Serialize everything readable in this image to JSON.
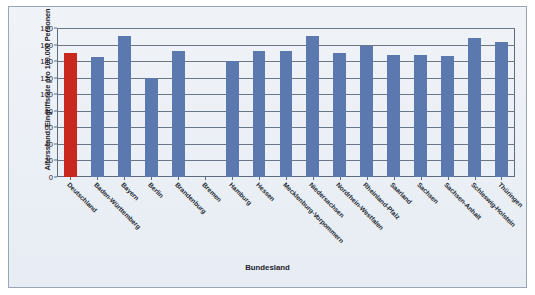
{
  "chart_data": {
    "type": "bar",
    "title": "",
    "xlabel": "Bundesland",
    "ylabel": "Altersstand. Eingriffsrate pro 100.000 Personen",
    "ylim": [
      0,
      180
    ],
    "ytick_values": [
      0,
      20,
      40,
      60,
      80,
      100,
      120,
      140,
      160,
      180
    ],
    "ytick_labels": [
      "0",
      "20",
      "40",
      "60",
      "80",
      "100",
      "120",
      "140",
      "160",
      "180"
    ],
    "grid": true,
    "legend": "none",
    "categories": [
      "Deutschland",
      "Baden-Württemberg",
      "Bayern",
      "Berlin",
      "Brandenburg",
      "Bremen",
      "Hamburg",
      "Hessen",
      "Mecklenburg-Vorpommern",
      "Niedersachsen",
      "Nordrhein-Westfalen",
      "Rheinland-Pfalz",
      "Saarland",
      "Sachsen",
      "Sachsen-Anhalt",
      "Schleswig-Holstein",
      "Thüringen"
    ],
    "values": [
      150,
      145,
      170,
      120,
      152,
      null,
      140,
      152,
      152,
      170,
      150,
      158,
      147,
      148,
      146,
      168,
      163
    ],
    "bar_colors": [
      "#C8281E",
      "#5B79AE",
      "#5B79AE",
      "#5B79AE",
      "#5B79AE",
      "#5B79AE",
      "#5B79AE",
      "#5B79AE",
      "#5B79AE",
      "#5B79AE",
      "#5B79AE",
      "#5B79AE",
      "#5B79AE",
      "#5B79AE",
      "#5B79AE",
      "#5B79AE",
      "#5B79AE"
    ],
    "highlight_category": "Deutschland",
    "highlight_color": "#C8281E",
    "series_color": "#5B79AE",
    "plot_background": "#E9EEF5",
    "axis_color": "#5F6B7A"
  }
}
